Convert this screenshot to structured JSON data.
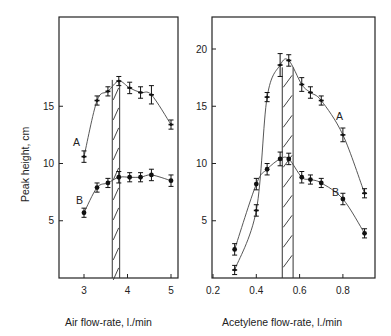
{
  "chart_data": [
    {
      "type": "line",
      "title": "",
      "xlabel": "Air flow-rate, l./min",
      "ylabel": "Peak height, cm",
      "xlim": [
        2.55,
        5.2
      ],
      "ylim": [
        0,
        23.5
      ],
      "xticks": [
        3,
        4,
        5
      ],
      "yticks": [
        5,
        10,
        15
      ],
      "grid": false,
      "legend": "inline labels A and B",
      "shaded_region": [
        3.65,
        3.82
      ],
      "series": [
        {
          "name": "A",
          "x": [
            3.0,
            3.3,
            3.55,
            3.8,
            4.05,
            4.3,
            4.55,
            5.0
          ],
          "y": [
            10.6,
            15.5,
            16.3,
            17.2,
            16.6,
            16.2,
            16.0,
            13.4
          ],
          "err": [
            0.5,
            0.4,
            0.4,
            0.4,
            0.5,
            0.5,
            0.8,
            0.4
          ]
        },
        {
          "name": "B",
          "x": [
            3.0,
            3.3,
            3.55,
            3.8,
            4.05,
            4.3,
            4.55,
            5.0
          ],
          "y": [
            5.7,
            7.9,
            8.3,
            8.8,
            8.8,
            8.8,
            9.0,
            8.5
          ],
          "err": [
            0.4,
            0.4,
            0.4,
            0.5,
            0.4,
            0.4,
            0.5,
            0.5
          ]
        }
      ]
    },
    {
      "type": "line",
      "title": "",
      "xlabel": "Acetylene flow-rate, l./min",
      "ylabel": "Peak height, cm",
      "xlim": [
        0.2,
        0.95
      ],
      "ylim": [
        0,
        23.5
      ],
      "xticks": [
        0.2,
        0.4,
        0.6,
        0.8
      ],
      "yticks": [
        5,
        10,
        15,
        20
      ],
      "grid": false,
      "legend": "inline labels A and B",
      "shaded_region": [
        0.52,
        0.57
      ],
      "series": [
        {
          "name": "A",
          "x": [
            0.3,
            0.4,
            0.45,
            0.51,
            0.55,
            0.61,
            0.65,
            0.7,
            0.8,
            0.9
          ],
          "y": [
            0.7,
            5.9,
            15.8,
            18.6,
            19.0,
            16.9,
            16.2,
            15.5,
            12.5,
            7.4
          ],
          "err": [
            0.4,
            0.5,
            0.4,
            1.0,
            0.5,
            0.6,
            0.5,
            0.4,
            0.6,
            0.4
          ]
        },
        {
          "name": "B",
          "x": [
            0.3,
            0.4,
            0.45,
            0.51,
            0.55,
            0.61,
            0.65,
            0.7,
            0.8,
            0.9
          ],
          "y": [
            2.5,
            8.2,
            9.5,
            10.4,
            10.4,
            8.8,
            8.6,
            8.3,
            6.9,
            3.9
          ],
          "err": [
            0.5,
            0.5,
            0.5,
            0.6,
            0.5,
            0.5,
            0.4,
            0.4,
            0.5,
            0.4
          ]
        }
      ]
    }
  ],
  "labels": {
    "left_xlabel": "Air flow-rate, l./min",
    "right_xlabel": "Acetylene flow-rate, l./min",
    "ylabel": "Peak height, cm",
    "series_a": "A",
    "series_b": "B"
  }
}
